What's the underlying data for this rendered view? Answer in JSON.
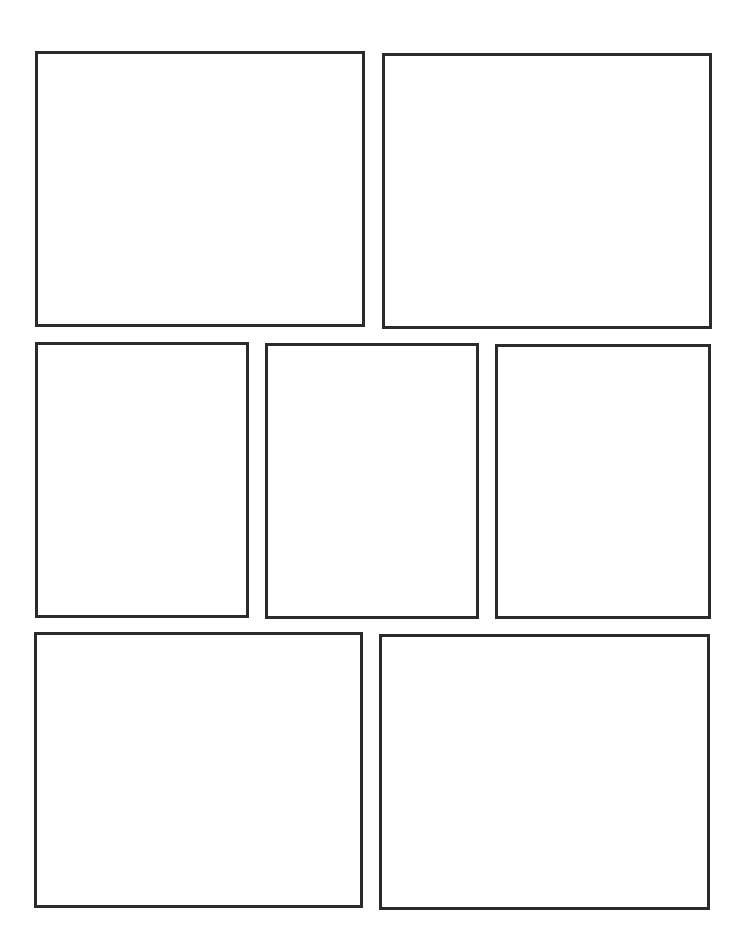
{
  "page": {
    "type": "blank comic page template",
    "background": "#ffffff",
    "border_color": "#2b2b2b",
    "border_width": 3
  },
  "rows": [
    {
      "panels": [
        {
          "id": "panel-1",
          "x": 35,
          "y": 51,
          "w": 330,
          "h": 276,
          "content": ""
        },
        {
          "id": "panel-2",
          "x": 382,
          "y": 53,
          "w": 330,
          "h": 276,
          "content": ""
        }
      ]
    },
    {
      "panels": [
        {
          "id": "panel-3",
          "x": 35,
          "y": 342,
          "w": 214,
          "h": 276,
          "content": ""
        },
        {
          "id": "panel-4",
          "x": 265,
          "y": 343,
          "w": 214,
          "h": 276,
          "content": ""
        },
        {
          "id": "panel-5",
          "x": 495,
          "y": 344,
          "w": 216,
          "h": 275,
          "content": ""
        }
      ]
    },
    {
      "panels": [
        {
          "id": "panel-6",
          "x": 34,
          "y": 632,
          "w": 329,
          "h": 276,
          "content": ""
        },
        {
          "id": "panel-7",
          "x": 379,
          "y": 634,
          "w": 331,
          "h": 276,
          "content": ""
        }
      ]
    }
  ]
}
